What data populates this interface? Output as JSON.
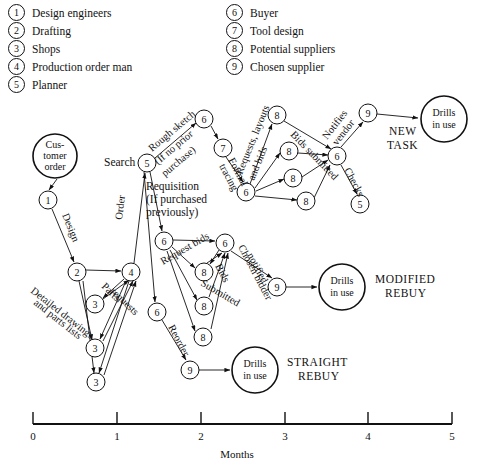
{
  "legend": {
    "left": [
      {
        "num": "1",
        "label": "Design engineers"
      },
      {
        "num": "2",
        "label": "Drafting"
      },
      {
        "num": "3",
        "label": "Shops"
      },
      {
        "num": "4",
        "label": "Production order man"
      },
      {
        "num": "5",
        "label": "Planner"
      }
    ],
    "right": [
      {
        "num": "6",
        "label": "Buyer"
      },
      {
        "num": "7",
        "label": "Tool design"
      },
      {
        "num": "8",
        "label": "Potential suppliers"
      },
      {
        "num": "9",
        "label": "Chosen supplier"
      }
    ]
  },
  "terminals": {
    "customer_order": {
      "line1": "Cus-",
      "line2": "tomer",
      "line3": "order"
    },
    "drills_new": {
      "line1": "Drills",
      "line2": "in use"
    },
    "drills_modified": {
      "line1": "Drills",
      "line2": "in use"
    },
    "drills_straight": {
      "line1": "Drills",
      "line2": "in use"
    }
  },
  "outcomes": {
    "new_task": {
      "line1": "NEW",
      "line2": "TASK"
    },
    "modified_rebuy": {
      "line1": "MODIFIED",
      "line2": "REBUY"
    },
    "straight_rebuy": {
      "line1": "STRAIGHT",
      "line2": "REBUY"
    }
  },
  "edge_labels": {
    "design": "Design",
    "detailed_drawings": "Detailed drawings",
    "and_parts_lists": "and parts lists",
    "parts": "Parts",
    "requests": "requests",
    "order": "Order",
    "search": "Search",
    "rough_sketch": "Rough sketch",
    "if_no_prior": "(If no prior",
    "purchase": "purchase)",
    "requisition": "Requisition",
    "if_purchased": "(If purchased",
    "previously": "previously)",
    "formal": "Formal",
    "tracing": "tracing",
    "requests_layouts": "Requests, layouts",
    "and_bids": "and bids",
    "bids_submitted_top": "Bids submitted",
    "notifies": "Notifies",
    "vendor": "vendor",
    "checks": "Checks",
    "request_bids": "Request bids",
    "bids": "Bids",
    "submitted": "Submitted",
    "chosen_bidder": "Chosen bidder",
    "notified": "notified",
    "reorder": "Reorder"
  },
  "nodes": [
    {
      "id": "n1",
      "num": "1",
      "x": 48,
      "y": 200
    },
    {
      "id": "n2",
      "num": "2",
      "x": 77,
      "y": 272
    },
    {
      "id": "n3a",
      "num": "3",
      "x": 95,
      "y": 304
    },
    {
      "id": "n3b",
      "num": "3",
      "x": 95,
      "y": 348
    },
    {
      "id": "n3c",
      "num": "3",
      "x": 96,
      "y": 382
    },
    {
      "id": "n4",
      "num": "4",
      "x": 131,
      "y": 272
    },
    {
      "id": "n5",
      "num": "5",
      "x": 147,
      "y": 163
    },
    {
      "id": "n6top",
      "num": "6",
      "x": 204,
      "y": 119
    },
    {
      "id": "n7",
      "num": "7",
      "x": 223,
      "y": 148
    },
    {
      "id": "n6mid",
      "num": "6",
      "x": 246,
      "y": 192
    },
    {
      "id": "n8a",
      "num": "8",
      "x": 277,
      "y": 115
    },
    {
      "id": "n8b",
      "num": "8",
      "x": 289,
      "y": 151
    },
    {
      "id": "n8c",
      "num": "8",
      "x": 293,
      "y": 178
    },
    {
      "id": "n8d",
      "num": "8",
      "x": 306,
      "y": 201
    },
    {
      "id": "n6r",
      "num": "6",
      "x": 337,
      "y": 156
    },
    {
      "id": "n9top",
      "num": "9",
      "x": 368,
      "y": 113
    },
    {
      "id": "n5r",
      "num": "5",
      "x": 360,
      "y": 204
    },
    {
      "id": "n6m1",
      "num": "6",
      "x": 164,
      "y": 241
    },
    {
      "id": "n6m2",
      "num": "6",
      "x": 225,
      "y": 243
    },
    {
      "id": "n8e",
      "num": "8",
      "x": 204,
      "y": 272
    },
    {
      "id": "n8f",
      "num": "8",
      "x": 204,
      "y": 306
    },
    {
      "id": "n8g",
      "num": "8",
      "x": 203,
      "y": 337
    },
    {
      "id": "n9mid",
      "num": "9",
      "x": 277,
      "y": 287
    },
    {
      "id": "n6low",
      "num": "6",
      "x": 157,
      "y": 312
    },
    {
      "id": "n9low",
      "num": "9",
      "x": 190,
      "y": 370
    }
  ],
  "axis": {
    "title": "Months",
    "ticks": [
      "0",
      "1",
      "2",
      "3",
      "4",
      "5"
    ]
  },
  "colors": {
    "ink": "#111111",
    "paper": "#ffffff"
  }
}
